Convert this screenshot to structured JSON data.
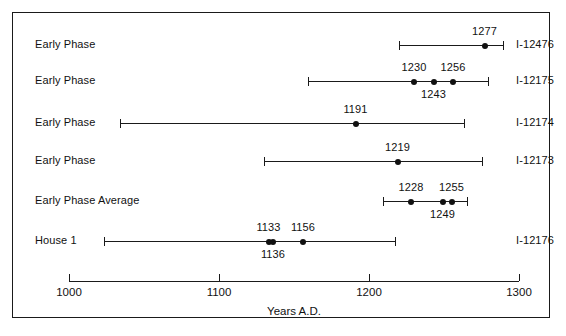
{
  "chart_data": {
    "type": "scatter",
    "title": "",
    "xlabel": "Years A.D.",
    "ylabel": "",
    "xlim": [
      1000,
      1300
    ],
    "xticks": [
      1000,
      1100,
      1200,
      1300
    ],
    "xtick_labels": [
      "1000",
      "1100",
      "1200",
      "1300"
    ],
    "grid": false,
    "legend": "none",
    "rows": [
      {
        "left_label": "Early Phase",
        "right_label": "I-12476",
        "range_low": 1220,
        "range_high": 1289,
        "points": [
          {
            "value": 1277,
            "label": "1277",
            "label_pos": "above"
          }
        ]
      },
      {
        "left_label": "Early Phase",
        "right_label": "I-12175",
        "range_low": 1159,
        "range_high": 1279,
        "points": [
          {
            "value": 1230,
            "label": "1230",
            "label_pos": "above"
          },
          {
            "value": 1243,
            "label": "1243",
            "label_pos": "below"
          },
          {
            "value": 1256,
            "label": "1256",
            "label_pos": "above"
          }
        ]
      },
      {
        "left_label": "Early Phase",
        "right_label": "I-12174",
        "range_low": 1034,
        "range_high": 1263,
        "points": [
          {
            "value": 1191,
            "label": "1191",
            "label_pos": "above"
          }
        ]
      },
      {
        "left_label": "Early Phase",
        "right_label": "I-12173",
        "range_low": 1130,
        "range_high": 1275,
        "points": [
          {
            "value": 1219,
            "label": "1219",
            "label_pos": "above"
          }
        ]
      },
      {
        "left_label": "Early Phase  Average",
        "right_label": "",
        "range_low": 1209,
        "range_high": 1265,
        "points": [
          {
            "value": 1228,
            "label": "1228",
            "label_pos": "above"
          },
          {
            "value": 1249,
            "label": "1249",
            "label_pos": "below"
          },
          {
            "value": 1255,
            "label": "1255",
            "label_pos": "above"
          }
        ]
      },
      {
        "left_label": "House 1",
        "right_label": "I-12176",
        "range_low": 1023,
        "range_high": 1217,
        "points": [
          {
            "value": 1133,
            "label": "1133",
            "label_pos": "above"
          },
          {
            "value": 1136,
            "label": "1136",
            "label_pos": "below"
          },
          {
            "value": 1156,
            "label": "1156",
            "label_pos": "above"
          }
        ]
      }
    ]
  },
  "colors": {
    "ink": "#111111",
    "frame": "#1a1a1a",
    "background": "#ffffff"
  }
}
